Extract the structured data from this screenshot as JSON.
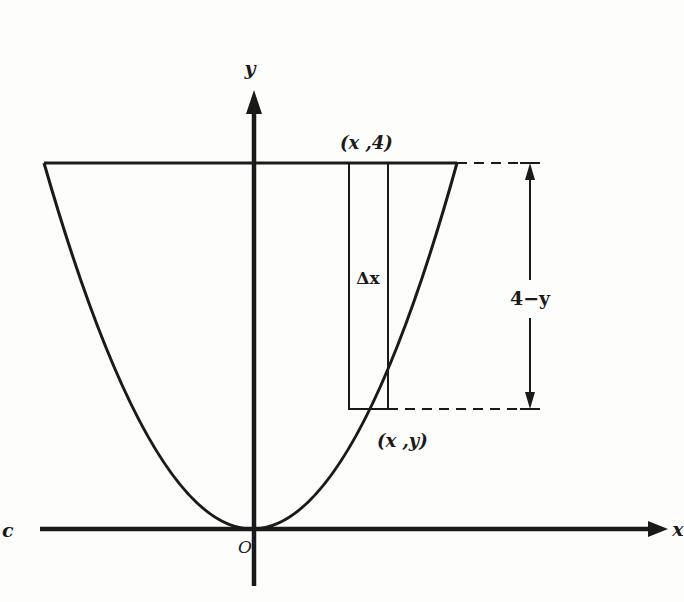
{
  "figure": {
    "type": "area-between-curves",
    "labels": {
      "y_axis": "y",
      "x_axis": "x",
      "origin": "O",
      "top_point": "(x ,4)",
      "curve_point": "(x ,y)",
      "strip_width": "Δx",
      "height_dimension": "4−y",
      "left_edge_fragment": "c"
    },
    "colors": {
      "ink": "#1a1a1a",
      "paper": "#fdfdfc"
    },
    "geometry": {
      "origin_px": [
        254,
        529
      ],
      "top_line_y_px": 163,
      "top_line_x_range_px": [
        44,
        457
      ],
      "strip_x_range_px": [
        349,
        388
      ],
      "strip_bottom_y_px": 409,
      "dimension_x_px": 530,
      "dashed_extent_px": 540,
      "x_axis_range_px": [
        40,
        668
      ],
      "y_axis_range_px": [
        90,
        586
      ]
    }
  }
}
